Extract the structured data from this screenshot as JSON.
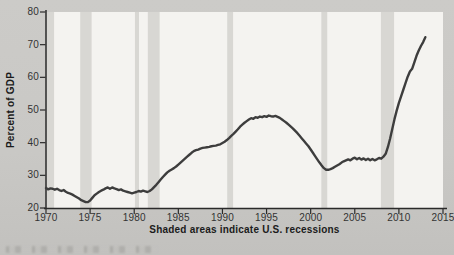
{
  "chart_data": {
    "type": "line",
    "title": "",
    "xlabel": "",
    "ylabel": "Percent of GDP",
    "annotation": "Shaded areas indicate U.S. recessions",
    "xlim": [
      1970,
      2015
    ],
    "ylim": [
      20,
      80
    ],
    "grid": false,
    "legend": "none",
    "x_ticks": [
      1970,
      1975,
      1980,
      1985,
      1990,
      1995,
      2000,
      2005,
      2010,
      2015
    ],
    "x_tick_labels": [
      "1970",
      "1975",
      "1980",
      "1985",
      "1990",
      "1995",
      "2000",
      "2005",
      "2010",
      "2015"
    ],
    "y_ticks": [
      20,
      30,
      40,
      50,
      60,
      70,
      80
    ],
    "y_tick_labels": [
      "20",
      "30",
      "40",
      "50",
      "60",
      "70",
      "80"
    ],
    "recession_bands": [
      [
        1970.0,
        1970.92
      ],
      [
        1973.88,
        1975.17
      ],
      [
        1980.08,
        1980.54
      ],
      [
        1981.54,
        1982.88
      ],
      [
        1990.54,
        1991.21
      ],
      [
        2001.21,
        2001.88
      ],
      [
        2007.96,
        2009.46
      ]
    ],
    "series": [
      {
        "name": "Percent of GDP",
        "points": [
          [
            1970.0,
            26.1
          ],
          [
            1970.25,
            25.7
          ],
          [
            1970.5,
            26.0
          ],
          [
            1970.75,
            25.9
          ],
          [
            1971.0,
            25.6
          ],
          [
            1971.25,
            25.9
          ],
          [
            1971.5,
            25.5
          ],
          [
            1971.75,
            25.2
          ],
          [
            1972.0,
            25.5
          ],
          [
            1972.25,
            25.0
          ],
          [
            1972.5,
            24.6
          ],
          [
            1972.75,
            24.4
          ],
          [
            1973.0,
            24.1
          ],
          [
            1973.25,
            23.7
          ],
          [
            1973.5,
            23.3
          ],
          [
            1973.75,
            22.9
          ],
          [
            1974.0,
            22.4
          ],
          [
            1974.25,
            22.1
          ],
          [
            1974.5,
            21.8
          ],
          [
            1974.75,
            21.8
          ],
          [
            1975.0,
            22.3
          ],
          [
            1975.25,
            23.1
          ],
          [
            1975.5,
            23.9
          ],
          [
            1975.75,
            24.4
          ],
          [
            1976.0,
            24.9
          ],
          [
            1976.25,
            25.3
          ],
          [
            1976.5,
            25.6
          ],
          [
            1976.75,
            26.0
          ],
          [
            1977.0,
            26.3
          ],
          [
            1977.25,
            25.9
          ],
          [
            1977.5,
            26.3
          ],
          [
            1977.75,
            26.0
          ],
          [
            1978.0,
            25.8
          ],
          [
            1978.25,
            25.5
          ],
          [
            1978.5,
            25.7
          ],
          [
            1978.75,
            25.3
          ],
          [
            1979.0,
            25.1
          ],
          [
            1979.25,
            24.9
          ],
          [
            1979.5,
            24.7
          ],
          [
            1979.75,
            24.5
          ],
          [
            1980.0,
            24.7
          ],
          [
            1980.25,
            24.9
          ],
          [
            1980.5,
            25.2
          ],
          [
            1980.75,
            25.0
          ],
          [
            1981.0,
            25.3
          ],
          [
            1981.25,
            25.1
          ],
          [
            1981.5,
            24.9
          ],
          [
            1981.75,
            25.2
          ],
          [
            1982.0,
            25.7
          ],
          [
            1982.25,
            26.4
          ],
          [
            1982.5,
            27.1
          ],
          [
            1982.75,
            27.9
          ],
          [
            1983.0,
            28.7
          ],
          [
            1983.25,
            29.5
          ],
          [
            1983.5,
            30.2
          ],
          [
            1983.75,
            30.9
          ],
          [
            1984.0,
            31.4
          ],
          [
            1984.25,
            31.8
          ],
          [
            1984.5,
            32.2
          ],
          [
            1984.75,
            32.7
          ],
          [
            1985.0,
            33.3
          ],
          [
            1985.25,
            33.9
          ],
          [
            1985.5,
            34.5
          ],
          [
            1985.75,
            35.1
          ],
          [
            1986.0,
            35.7
          ],
          [
            1986.25,
            36.3
          ],
          [
            1986.5,
            36.9
          ],
          [
            1986.75,
            37.4
          ],
          [
            1987.0,
            37.7
          ],
          [
            1987.25,
            37.9
          ],
          [
            1987.5,
            38.2
          ],
          [
            1987.75,
            38.4
          ],
          [
            1988.0,
            38.5
          ],
          [
            1988.25,
            38.6
          ],
          [
            1988.5,
            38.7
          ],
          [
            1988.75,
            38.9
          ],
          [
            1989.0,
            39.0
          ],
          [
            1989.25,
            39.1
          ],
          [
            1989.5,
            39.3
          ],
          [
            1989.75,
            39.5
          ],
          [
            1990.0,
            39.9
          ],
          [
            1990.25,
            40.3
          ],
          [
            1990.5,
            40.8
          ],
          [
            1990.75,
            41.4
          ],
          [
            1991.0,
            42.1
          ],
          [
            1991.25,
            42.7
          ],
          [
            1991.5,
            43.4
          ],
          [
            1991.75,
            44.1
          ],
          [
            1992.0,
            44.9
          ],
          [
            1992.25,
            45.5
          ],
          [
            1992.5,
            46.1
          ],
          [
            1992.75,
            46.6
          ],
          [
            1993.0,
            47.1
          ],
          [
            1993.25,
            47.5
          ],
          [
            1993.5,
            47.3
          ],
          [
            1993.75,
            47.8
          ],
          [
            1994.0,
            47.6
          ],
          [
            1994.25,
            48.0
          ],
          [
            1994.5,
            47.8
          ],
          [
            1994.75,
            48.1
          ],
          [
            1995.0,
            47.9
          ],
          [
            1995.25,
            48.3
          ],
          [
            1995.5,
            48.1
          ],
          [
            1995.75,
            48.0
          ],
          [
            1996.0,
            48.2
          ],
          [
            1996.25,
            47.9
          ],
          [
            1996.5,
            47.6
          ],
          [
            1996.75,
            47.1
          ],
          [
            1997.0,
            46.6
          ],
          [
            1997.25,
            46.1
          ],
          [
            1997.5,
            45.5
          ],
          [
            1997.75,
            44.9
          ],
          [
            1998.0,
            44.3
          ],
          [
            1998.25,
            43.6
          ],
          [
            1998.5,
            42.9
          ],
          [
            1998.75,
            42.1
          ],
          [
            1999.0,
            41.3
          ],
          [
            1999.25,
            40.5
          ],
          [
            1999.5,
            39.7
          ],
          [
            1999.75,
            38.9
          ],
          [
            2000.0,
            37.9
          ],
          [
            2000.25,
            36.9
          ],
          [
            2000.5,
            35.9
          ],
          [
            2000.75,
            34.9
          ],
          [
            2001.0,
            33.9
          ],
          [
            2001.25,
            33.0
          ],
          [
            2001.5,
            32.2
          ],
          [
            2001.75,
            31.7
          ],
          [
            2002.0,
            31.7
          ],
          [
            2002.25,
            31.9
          ],
          [
            2002.5,
            32.2
          ],
          [
            2002.75,
            32.6
          ],
          [
            2003.0,
            33.0
          ],
          [
            2003.25,
            33.4
          ],
          [
            2003.5,
            33.9
          ],
          [
            2003.75,
            34.3
          ],
          [
            2004.0,
            34.6
          ],
          [
            2004.25,
            34.9
          ],
          [
            2004.5,
            34.6
          ],
          [
            2004.75,
            35.1
          ],
          [
            2005.0,
            35.4
          ],
          [
            2005.25,
            34.9
          ],
          [
            2005.5,
            35.3
          ],
          [
            2005.75,
            34.8
          ],
          [
            2006.0,
            35.2
          ],
          [
            2006.25,
            34.7
          ],
          [
            2006.5,
            35.1
          ],
          [
            2006.75,
            34.6
          ],
          [
            2007.0,
            35.0
          ],
          [
            2007.25,
            34.6
          ],
          [
            2007.5,
            34.9
          ],
          [
            2007.75,
            35.3
          ],
          [
            2008.0,
            35.1
          ],
          [
            2008.25,
            35.7
          ],
          [
            2008.5,
            36.6
          ],
          [
            2008.75,
            38.6
          ],
          [
            2009.0,
            41.2
          ],
          [
            2009.25,
            44.2
          ],
          [
            2009.5,
            47.2
          ],
          [
            2009.75,
            49.8
          ],
          [
            2010.0,
            52.2
          ],
          [
            2010.25,
            54.2
          ],
          [
            2010.5,
            56.2
          ],
          [
            2010.75,
            58.2
          ],
          [
            2011.0,
            60.2
          ],
          [
            2011.25,
            61.8
          ],
          [
            2011.5,
            62.6
          ],
          [
            2011.75,
            64.6
          ],
          [
            2012.0,
            66.6
          ],
          [
            2012.25,
            68.2
          ],
          [
            2012.5,
            69.6
          ],
          [
            2012.75,
            70.8
          ],
          [
            2013.0,
            72.3
          ]
        ]
      }
    ],
    "colors": {
      "figure_bg": "#c9c8c5",
      "plot_bg": "#f4f3f0",
      "recession_band": "#d8d7d3",
      "axis": "#2a2a2a",
      "line": "#3e3e3e",
      "tick_label": "#333333",
      "text": "#1b1b1b"
    }
  }
}
